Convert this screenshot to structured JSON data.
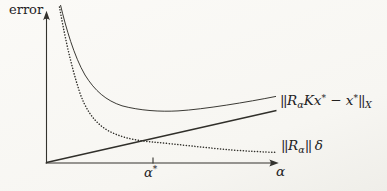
{
  "figure": {
    "background": "#f7f6f2",
    "ink": "#302f2a"
  },
  "axes": {
    "y_label": "error",
    "x_label": "α",
    "x_tick": {
      "base": "α",
      "sup": "*"
    },
    "y_axis_path": "M46.5 163.5 L46.5 13.5",
    "x_axis_path": "M45.5 163 L276 163",
    "y_arrow_path": "M46.5 10.8 L43.1 20.2 Q46.5 17.3 49.9 20.2 Z",
    "x_arrow_path": "M278.8 163 L269.3 159.6 Q272.2 163 269.3 166.4 Z",
    "tick_path": "M153 157.5 L153 163.5"
  },
  "chart_data": {
    "type": "line",
    "title": "",
    "xlabel": "α",
    "ylabel": "error",
    "axes_numeric": false,
    "grid": false,
    "legend_position": "labels at right end of curves",
    "annotations": [
      {
        "text": "α*",
        "axis": "x",
        "x_px": 153,
        "meaning": "optimal regularization parameter, below crossing of the two component curves"
      }
    ],
    "series": [
      {
        "name": "total error (unlabeled, sum of both components)",
        "style": "solid thin",
        "shape": "U-shaped: steep decrease, flat minimum near α*, slow increase",
        "points_px": [
          [
            60,
            5
          ],
          [
            85,
            75
          ],
          [
            102,
            97
          ],
          [
            122,
            106
          ],
          [
            150,
            111
          ],
          [
            178,
            111
          ],
          [
            210,
            108
          ],
          [
            248,
            102
          ],
          [
            276,
            96
          ]
        ],
        "svg_path": "M60.5 5 C66 28 74 56 85 75 C95 91 106 100.5 122 105.8 C140 110.6 160 111.9 178 110.9 C204 109.3 248 102 276 96.4"
      },
      {
        "name": "||R_α|| δ (data noise error)",
        "style": "dotted",
        "shape": "monotonically decreasing, flattening to the right",
        "points_px": [
          [
            59,
            7
          ],
          [
            79,
            90
          ],
          [
            95,
            122
          ],
          [
            107,
            130
          ],
          [
            130,
            137
          ],
          [
            153,
            142
          ],
          [
            200,
            147
          ],
          [
            232,
            150
          ],
          [
            276,
            152
          ]
        ],
        "svg_path": "M59.5 7 C64 32 70 62 79 90 C85 109 94 122 107 130 C121 138 138 140.8 153 142 C176 144.2 206 147.8 232 150 C248 151.2 264 152 276 152.4"
      },
      {
        "name": "||R_α K x* − x*||_X (approximation error)",
        "style": "solid, slightly thicker",
        "shape": "straight line increasing from the origin",
        "points_px": [
          [
            46,
            162
          ],
          [
            276,
            110
          ]
        ],
        "svg_path": "M46.5 162.5 L276.5 110.5"
      }
    ]
  },
  "labels": {
    "approx_error": {
      "norm1": "||",
      "R": "R",
      "Rsub": "α",
      "K": "K",
      "x1": "x",
      "sup1": "*",
      "minus": " − ",
      "x2": "x",
      "sup2": "*",
      "norm2": "||",
      "subX": "X"
    },
    "data_error": {
      "norm1": "||",
      "R": "R",
      "Rsub": "α",
      "norm2": "||",
      "delta": "δ"
    }
  }
}
